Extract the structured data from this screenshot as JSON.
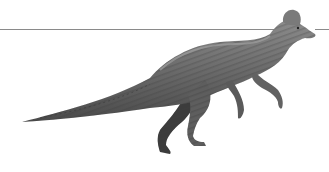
{
  "image": {
    "subject": "Grayscale illustration of a crested hadrosaur dinosaur walking on hind legs",
    "background_color": "#ffffff",
    "horizon_line_color": "#8a8a8a",
    "body_color": "#6e6e6e",
    "shadow_color": "#3a3a3a",
    "highlight_color": "#a8a8a8"
  }
}
